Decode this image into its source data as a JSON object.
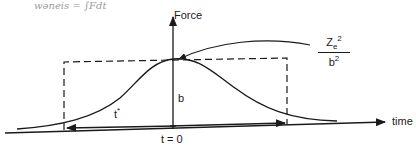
{
  "handwritten_note": "wǝneis = ∫Fdt",
  "axes": {
    "y_label": "Force",
    "x_label": "time"
  },
  "labels": {
    "duration": "t*",
    "duration_base": "t",
    "duration_sup": "*",
    "impact_parameter": "b",
    "origin": "t = 0"
  },
  "peak_expression": {
    "numerator_base": "Z",
    "numerator_sub": "e",
    "numerator_sup": "2",
    "denominator_base": "b",
    "denominator_sup": "2"
  },
  "colors": {
    "ink": "#1a1a1a",
    "pencil": "#9a9a9a",
    "background": "#ffffff"
  }
}
